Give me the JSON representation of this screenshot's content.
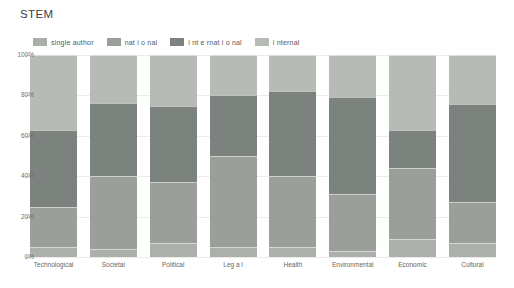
{
  "title": "STEM",
  "axis": {
    "y_ticks": [
      {
        "label": "100%",
        "value": 100
      },
      {
        "label": "80%",
        "value": 80
      },
      {
        "label": "60%",
        "value": 60
      },
      {
        "label": "40%",
        "value": 40
      },
      {
        "label": "20%",
        "value": 20
      },
      {
        "label": "0%",
        "value": 0
      }
    ]
  },
  "chart_data": {
    "type": "bar",
    "stacked": true,
    "title": "STEM",
    "xlabel": "",
    "ylabel": "",
    "ylim": [
      0,
      100
    ],
    "y_unit": "percent",
    "grid": true,
    "legend_position": "top-left",
    "categories": [
      "Technological",
      "Societal",
      "Political",
      "Leg a l",
      "Health",
      "Environmental",
      "Economic",
      "Cultural"
    ],
    "series": [
      {
        "name": "single author",
        "color": "#abb0aa",
        "values": [
          5,
          4,
          7,
          5,
          5,
          3,
          9,
          7
        ]
      },
      {
        "name": "nat i o nal",
        "color": "#9aa099",
        "values": [
          20,
          36,
          30,
          45,
          35,
          28,
          35,
          20
        ]
      },
      {
        "name": "i nt e rnat i o nal",
        "color": "#7c827d",
        "values": [
          38,
          36,
          38,
          30,
          42,
          48,
          19,
          49
        ]
      },
      {
        "name": "i nternal",
        "color": "#b6bbb5",
        "values": [
          37,
          24,
          25,
          20,
          18,
          21,
          37,
          24
        ]
      }
    ]
  }
}
